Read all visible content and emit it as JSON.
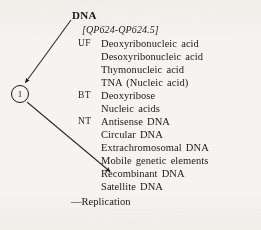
{
  "page": {
    "heading": "DNA",
    "classification": "[QP624-QP624.5]",
    "subdivision": "—Replication",
    "marker_label": "1",
    "ink_color": "#1b1917",
    "paper_color": "#f6f4f1"
  },
  "entries": [
    {
      "code": "UF",
      "term": "Deoxyribonucleic acid"
    },
    {
      "code": "",
      "term": "Desoxyribonucleic acid"
    },
    {
      "code": "",
      "term": "Thymonucleic acid"
    },
    {
      "code": "",
      "term": "TNA (Nucleic acid)"
    },
    {
      "code": "BT",
      "term": "Deoxyribose"
    },
    {
      "code": "",
      "term": "Nucleic acids"
    },
    {
      "code": "NT",
      "term": "Antisense DNA"
    },
    {
      "code": "",
      "term": "Circular DNA"
    },
    {
      "code": "",
      "term": "Extrachromosomal DNA"
    },
    {
      "code": "",
      "term": "Mobile genetic elements"
    },
    {
      "code": "",
      "term": "Recombinant DNA"
    },
    {
      "code": "",
      "term": "Satellite DNA"
    }
  ],
  "annotations": {
    "arrow_one": {
      "from_label": "DNA",
      "to_label": "marker-1"
    },
    "arrow_two": {
      "from_label": "marker-1",
      "to_label": "Recombinant DNA"
    }
  }
}
